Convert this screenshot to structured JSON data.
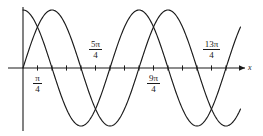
{
  "figure": {
    "title": "",
    "background_color": "#ffffff",
    "curve_color": "#1a1a1a",
    "axis_color": "#1a1a1a",
    "width": 263,
    "height": 136
  },
  "axes": {
    "x_axis_label": "x",
    "y_axis_label": "",
    "x_axis_has_arrow": true,
    "origin_px": {
      "x": 23,
      "y": 68
    },
    "unit_px_per_quarter_pi": 14.5,
    "amplitude_px": 58
  },
  "tick_labels": [
    {
      "text_num": "π",
      "text_den": "4",
      "value": "pi/4",
      "position": "below",
      "tick_index": 1
    },
    {
      "text_num": "5π",
      "text_den": "4",
      "value": "5pi/4",
      "position": "above",
      "tick_index": 5
    },
    {
      "text_num": "9π",
      "text_den": "4",
      "value": "9pi/4",
      "position": "below",
      "tick_index": 9
    },
    {
      "text_num": "13π",
      "text_den": "4",
      "value": "13pi/4",
      "position": "above",
      "tick_index": 13
    }
  ],
  "chart_data": {
    "type": "line",
    "title": "",
    "xlabel": "x",
    "ylabel": "",
    "xlim": [
      -0.35,
      15.2
    ],
    "ylim": [
      -1.15,
      1.15
    ],
    "grid": false,
    "legend": "none",
    "x_unit": "pi/4",
    "x_tick_values": [
      "0",
      "pi/4",
      "pi/2",
      "3pi/4",
      "pi",
      "5pi/4",
      "3pi/2",
      "7pi/4",
      "2pi",
      "9pi/4",
      "5pi/2",
      "11pi/4",
      "3pi",
      "13pi/4",
      "7pi/2",
      "15pi/4",
      "4pi"
    ],
    "x_labeled_ticks": [
      "pi/4",
      "5pi/4",
      "9pi/4",
      "13pi/4"
    ],
    "series": [
      {
        "name": "cosine-curve",
        "equation": "y = cos(x)",
        "amplitude": 1,
        "period": "2pi",
        "phase": "0",
        "description": "starts at maximum on the y-axis, descends through zero at pi/2",
        "key_points": [
          {
            "x": "0",
            "y": 1
          },
          {
            "x": "pi/2",
            "y": 0
          },
          {
            "x": "pi",
            "y": -1
          },
          {
            "x": "3pi/2",
            "y": 0
          },
          {
            "x": "2pi",
            "y": 1
          },
          {
            "x": "5pi/2",
            "y": 0
          },
          {
            "x": "3pi",
            "y": -1
          },
          {
            "x": "7pi/2",
            "y": 0
          },
          {
            "x": "4pi",
            "y": 1
          }
        ]
      },
      {
        "name": "sine-curve",
        "equation": "y = sin(x)",
        "amplitude": 1,
        "period": "2pi",
        "phase": "0",
        "description": "starts at zero on the y-axis, rises to maximum at pi/2",
        "key_points": [
          {
            "x": "0",
            "y": 0
          },
          {
            "x": "pi/2",
            "y": 1
          },
          {
            "x": "pi",
            "y": 0
          },
          {
            "x": "3pi/2",
            "y": -1
          },
          {
            "x": "2pi",
            "y": 0
          },
          {
            "x": "5pi/2",
            "y": 1
          },
          {
            "x": "3pi",
            "y": 0
          },
          {
            "x": "7pi/2",
            "y": -1
          },
          {
            "x": "4pi",
            "y": 0
          }
        ]
      }
    ]
  }
}
